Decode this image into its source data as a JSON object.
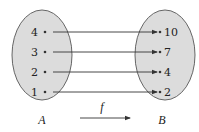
{
  "diagram": {
    "type": "function-mapping",
    "function_label": "f",
    "colors": {
      "set_fill": "#dcdcdc",
      "set_stroke": "#666666",
      "arrow": "#333333",
      "text": "#222222"
    },
    "domain": {
      "label": "A",
      "elements": [
        "4",
        "3",
        "2",
        "1"
      ]
    },
    "codomain": {
      "label": "B",
      "elements": [
        "10",
        "7",
        "4",
        "2"
      ]
    },
    "mappings": [
      {
        "from": "4",
        "to": "10"
      },
      {
        "from": "3",
        "to": "7"
      },
      {
        "from": "2",
        "to": "4"
      },
      {
        "from": "1",
        "to": "2"
      }
    ]
  }
}
